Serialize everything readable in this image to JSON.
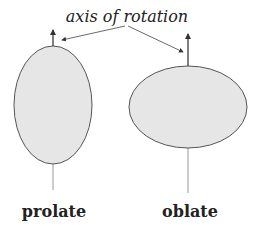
{
  "title": "axis of rotation",
  "shapes": [
    {
      "name": "prolate",
      "label": "prolate"
    },
    {
      "name": "oblate",
      "label": "oblate"
    }
  ],
  "colors": {
    "fill": "#e6e6e6",
    "stroke": "#555555",
    "axis": "#999999",
    "text": "#222222"
  }
}
